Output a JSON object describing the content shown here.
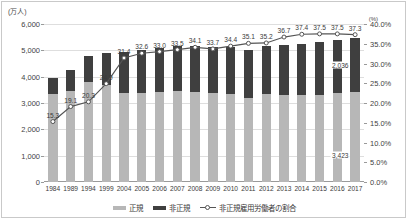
{
  "chart_data": {
    "type": "bar",
    "title": "",
    "subtitle": "",
    "xlabel": "",
    "ylabel": "(万人)",
    "y2label": "(%)",
    "categories": [
      "1984",
      "1989",
      "1994",
      "1999",
      "2004",
      "2005",
      "2006",
      "2007",
      "2008",
      "2009",
      "2010",
      "2011",
      "2012",
      "2013",
      "2014",
      "2015",
      "2016",
      "2017"
    ],
    "ylim": [
      0,
      6000
    ],
    "y2lim": [
      0,
      40
    ],
    "yticks": [
      "0",
      "1,000",
      "2,000",
      "3,000",
      "4,000",
      "5,000",
      "6,000"
    ],
    "y2ticks": [
      "0.0%",
      "5.0%",
      "10.0%",
      "15.0%",
      "20.0%",
      "25.0%",
      "30.0%",
      "35.0%",
      "40.0%"
    ],
    "grid": true,
    "legend_position": "bottom",
    "series": [
      {
        "name": "正規",
        "type": "bar",
        "stack": "total",
        "color": "#b7b7b7",
        "values": [
          3333,
          3452,
          3805,
          3688,
          3380,
          3375,
          3415,
          3449,
          3410,
          3395,
          3355,
          3185,
          3345,
          3302,
          3288,
          3317,
          3367,
          3423
        ]
      },
      {
        "name": "非正規",
        "type": "bar",
        "stack": "total",
        "color": "#3f3f3f",
        "values": [
          604,
          817,
          971,
          1225,
          1555,
          1633,
          1677,
          1735,
          1760,
          1721,
          1763,
          1812,
          1816,
          1910,
          1967,
          1986,
          2023,
          2036
        ]
      },
      {
        "name": "非正規雇用労働者の割合",
        "type": "line",
        "axis": "y2",
        "color": "#555555",
        "values": [
          15.3,
          19.1,
          20.3,
          24.9,
          31.4,
          32.6,
          33.0,
          33.5,
          34.1,
          33.7,
          34.4,
          35.1,
          35.2,
          36.7,
          37.4,
          37.5,
          37.5,
          37.3
        ],
        "labels": [
          "15.3",
          "19.1",
          "20.3",
          "24.9",
          "31.4",
          "32.6",
          "33.0",
          "33.5",
          "34.1",
          "33.7",
          "34.4",
          "35.1",
          "35.2",
          "36.7",
          "37.4",
          "37.5",
          "37.5",
          "37.3"
        ]
      }
    ],
    "annotations": [
      {
        "text": "2,036",
        "series": "非正規",
        "category": "2017"
      },
      {
        "text": "3,423",
        "series": "正規",
        "category": "2017"
      }
    ]
  },
  "legend": {
    "items": [
      {
        "label": "正規",
        "color": "#b7b7b7",
        "marker": "bar"
      },
      {
        "label": "非正規",
        "color": "#3f3f3f",
        "marker": "bar"
      },
      {
        "label": "非正規雇用労働者の割合",
        "color": "#555555",
        "marker": "line"
      }
    ]
  }
}
